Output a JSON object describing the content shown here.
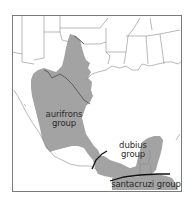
{
  "map": {
    "region": "Southern United States, Mexico and Central America",
    "colors": {
      "range_fill": "#a3a3a3",
      "borders": "#8a8a8a",
      "frame": "#7a7a7a",
      "divider": "#111111",
      "background": "#ffffff"
    },
    "labels": {
      "aurifrons_line1": "aurifrons",
      "aurifrons_line2": "group",
      "dubius_line1": "dubius",
      "dubius_line2": "group",
      "santacruzi": "santacruzi group"
    }
  }
}
